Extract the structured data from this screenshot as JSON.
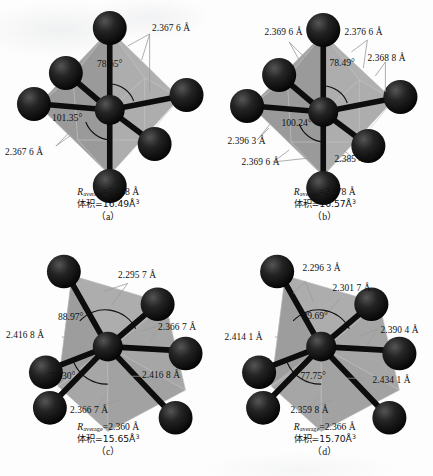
{
  "figure": {
    "type": "crystal-structure-polyhedra",
    "panel_count": 4,
    "colors": {
      "sphere": "#1a1a1a",
      "bond": "#101010",
      "polyhedron_fill": "#a3a3a3",
      "leader_line": "#8d8d8d",
      "background": "#fdfdfd"
    }
  },
  "panels": [
    {
      "id": "a",
      "label": "（a）",
      "r_average_symbol": "R",
      "r_average_sub": "average",
      "r_average_value": "=2.368 Å",
      "volume_label": "体积",
      "volume_value": "=16.49Å",
      "volume_sup": "3",
      "bond_labels": [
        {
          "text": "2.367 6 Å",
          "x": 152,
          "y": 24
        },
        {
          "text": "2.367 6 Å",
          "x": 5,
          "y": 148
        }
      ],
      "angle_labels": [
        {
          "text": "78.65°",
          "x": 97,
          "y": 58
        },
        {
          "text": "101.35°",
          "x": 52,
          "y": 112
        }
      ]
    },
    {
      "id": "b",
      "label": "（b）",
      "r_average_symbol": "R",
      "r_average_sub": "average",
      "r_average_value": "=2.378 Å",
      "volume_label": "体积",
      "volume_value": "=16.57Å",
      "volume_sup": "3",
      "bond_labels": [
        {
          "text": "2.369 6 Å",
          "x": 265,
          "y": 28
        },
        {
          "text": "2.376 6 Å",
          "x": 345,
          "y": 28
        },
        {
          "text": "2.368 8 Å",
          "x": 368,
          "y": 54
        },
        {
          "text": "2.396 3 Å",
          "x": 228,
          "y": 137
        },
        {
          "text": "2.369 6 Å",
          "x": 242,
          "y": 158
        },
        {
          "text": "2.385 4 Å",
          "x": 335,
          "y": 155
        }
      ],
      "angle_labels": [
        {
          "text": "78.49°",
          "x": 330,
          "y": 57
        },
        {
          "text": "100.24°",
          "x": 282,
          "y": 117
        }
      ]
    },
    {
      "id": "c",
      "label": "（c）",
      "r_average_symbol": "R",
      "r_average_sub": "average",
      "r_average_value": "=2.360 Å",
      "volume_label": "体积",
      "volume_value": "=15.65Å",
      "volume_sup": "3",
      "bond_labels": [
        {
          "text": "2.295 7 Å",
          "x": 118,
          "y": 268
        },
        {
          "text": "2.366 7 Å",
          "x": 158,
          "y": 320
        },
        {
          "text": "2.416 8 Å",
          "x": 6,
          "y": 328
        },
        {
          "text": "2.416 8 Å",
          "x": 142,
          "y": 368
        },
        {
          "text": "2.366 7 Å",
          "x": 70,
          "y": 403
        }
      ],
      "angle_labels": [
        {
          "text": "88.97°",
          "x": 58,
          "y": 308
        },
        {
          "text": "78.30°",
          "x": 50,
          "y": 367
        }
      ]
    },
    {
      "id": "d",
      "label": "（d）",
      "r_average_symbol": "R",
      "r_average_sub": "average",
      "r_average_value": "=2.366 Å",
      "volume_label": "体积",
      "volume_value": "=15.70Å",
      "volume_sup": "3",
      "bond_labels": [
        {
          "text": "2.296 3 Å",
          "x": 300,
          "y": 261
        },
        {
          "text": "2.301 7 Å",
          "x": 330,
          "y": 281
        },
        {
          "text": "2.390 4 Å",
          "x": 378,
          "y": 323
        },
        {
          "text": "2.414 1 Å",
          "x": 222,
          "y": 330
        },
        {
          "text": "2.434 1 Å",
          "x": 370,
          "y": 373
        },
        {
          "text": "2.359 8 Å",
          "x": 288,
          "y": 403
        }
      ],
      "angle_labels": [
        {
          "text": "89.69°",
          "x": 300,
          "y": 307
        },
        {
          "text": "77.75°",
          "x": 298,
          "y": 367
        }
      ]
    }
  ]
}
